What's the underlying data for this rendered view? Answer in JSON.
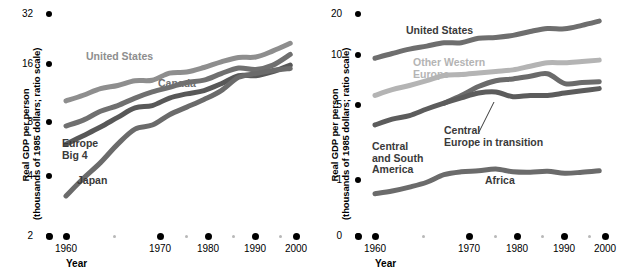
{
  "figure": {
    "title": "",
    "panels": [
      "left",
      "right"
    ]
  },
  "left": {
    "ylabel_line1": "Real GDP per person",
    "ylabel_line2": "(thousands of 1985 dollars; ratio scale)",
    "xlabel": "Year",
    "yticks": [
      "32",
      "16",
      "8",
      "4",
      "2"
    ],
    "xticks": [
      "1960",
      "1970",
      "1980",
      "1990",
      "2000"
    ],
    "minor_xticks": [
      "1965",
      "1975",
      "1985",
      "1995"
    ],
    "series_labels": {
      "united_states": "United States",
      "canada": "Canada",
      "europe_big_4": "Europe\nBig 4",
      "europe_big_4_l1": "Europe",
      "europe_big_4_l2": "Big 4",
      "japan": "Japan"
    },
    "colors": {
      "united_states": "#8e8e8e",
      "canada": "#707070",
      "europe_big_4": "#585858",
      "japan": "#6b6b6b",
      "axis": "#000000",
      "minor_tick": "#b8b8b8"
    }
  },
  "right": {
    "ylabel_line1": "Real GDP per person",
    "ylabel_line2": "(thousands of 1985 dollars; ratio scale)",
    "xlabel": "Year",
    "yticks": [
      "20",
      "10",
      "5",
      "1",
      "0"
    ],
    "xticks": [
      "1960",
      "1970",
      "1980",
      "1990",
      "2000"
    ],
    "minor_xticks": [
      "1965",
      "1975",
      "1985",
      "1995"
    ],
    "series_labels": {
      "united_states": "United States",
      "other_western_europe_l1": "Other Western",
      "other_western_europe_l2": "Europe",
      "central_europe_l1": "Central",
      "central_europe_l2": "Europe in transition",
      "central_south_america_l1": "Central",
      "central_south_america_l2": "and South",
      "central_south_america_l3": "America",
      "africa": "Africa"
    },
    "colors": {
      "united_states": "#6e6e6e",
      "other_western_europe": "#b4b4b4",
      "central_europe": "#6b6b6b",
      "central_south_america": "#5c5c5c",
      "africa": "#6b6b6b",
      "axis": "#000000",
      "minor_tick": "#b8b8b8"
    }
  },
  "chart_data": [
    {
      "type": "line",
      "panel": "left",
      "title": "",
      "xlabel": "Year",
      "ylabel": "Real GDP per person (thousands of 1985 dollars; ratio scale)",
      "scale": "log2",
      "xlim": [
        1960,
        2000
      ],
      "ylim": [
        2,
        32
      ],
      "yticks": [
        2,
        4,
        8,
        16,
        32
      ],
      "xticks": [
        1960,
        1970,
        1980,
        1990,
        2000
      ],
      "grid": false,
      "legend": "inline-annotations",
      "x": [
        1960,
        1963,
        1966,
        1969,
        1972,
        1975,
        1978,
        1981,
        1984,
        1987,
        1990,
        1993,
        1996,
        1999
      ],
      "series": [
        {
          "name": "United States",
          "color": "#8e8e8e",
          "values": [
            10.8,
            11.6,
            12.6,
            13.1,
            13.9,
            14.0,
            15.3,
            15.5,
            16.4,
            17.6,
            18.6,
            18.7,
            20.2,
            22.2
          ]
        },
        {
          "name": "Canada",
          "color": "#707070",
          "values": [
            7.9,
            8.5,
            9.5,
            10.2,
            11.2,
            12.1,
            12.8,
            13.6,
            14.0,
            15.2,
            16.3,
            16.0,
            16.9,
            19.3
          ]
        },
        {
          "name": "Europe Big 4",
          "color": "#585858",
          "values": [
            6.3,
            7.0,
            7.8,
            8.8,
            9.9,
            10.2,
            11.2,
            11.8,
            12.3,
            13.4,
            14.8,
            14.8,
            15.6,
            16.9
          ]
        },
        {
          "name": "Japan",
          "color": "#6b6b6b",
          "values": [
            3.3,
            4.1,
            5.0,
            6.3,
            7.6,
            8.0,
            9.1,
            10.0,
            11.0,
            12.3,
            14.5,
            15.2,
            15.8,
            16.2
          ]
        }
      ]
    },
    {
      "type": "line",
      "panel": "right",
      "title": "",
      "xlabel": "Year",
      "ylabel": "Real GDP per person (thousands of 1985 dollars; ratio scale)",
      "scale": "log",
      "xlim": [
        1960,
        2000
      ],
      "ylim": [
        0,
        20
      ],
      "yticks": [
        0,
        1,
        5,
        10,
        20
      ],
      "xticks": [
        1960,
        1970,
        1980,
        1990,
        2000
      ],
      "grid": false,
      "legend": "inline-annotations",
      "x": [
        1960,
        1963,
        1966,
        1969,
        1972,
        1975,
        1978,
        1981,
        1984,
        1987,
        1990,
        1993,
        1996,
        1999
      ],
      "series": [
        {
          "name": "United States",
          "color": "#6e6e6e",
          "values": [
            9.0,
            9.8,
            10.6,
            11.2,
            11.9,
            11.9,
            12.9,
            13.1,
            13.6,
            14.6,
            15.4,
            15.3,
            16.3,
            17.6
          ]
        },
        {
          "name": "Other Western Europe",
          "color": "#b4b4b4",
          "values": [
            4.6,
            5.1,
            5.5,
            6.0,
            6.6,
            6.7,
            6.9,
            7.1,
            7.3,
            7.8,
            8.3,
            8.3,
            8.5,
            8.7
          ]
        },
        {
          "name": "Central Europe in transition",
          "color": "#6b6b6b",
          "values": [
            null,
            null,
            null,
            null,
            4.0,
            4.6,
            5.4,
            6.0,
            6.2,
            6.5,
            6.8,
            5.7,
            5.8,
            5.9
          ]
        },
        {
          "name": "Central and South America",
          "color": "#5c5c5c",
          "values": [
            2.7,
            3.0,
            3.2,
            3.6,
            4.0,
            4.4,
            4.8,
            4.9,
            4.5,
            4.6,
            4.6,
            4.8,
            5.0,
            5.2
          ]
        },
        {
          "name": "Africa",
          "color": "#6b6b6b",
          "values": [
            0.78,
            0.82,
            0.88,
            0.96,
            1.1,
            1.16,
            1.18,
            1.22,
            1.16,
            1.15,
            1.17,
            1.13,
            1.15,
            1.18
          ]
        }
      ]
    }
  ]
}
